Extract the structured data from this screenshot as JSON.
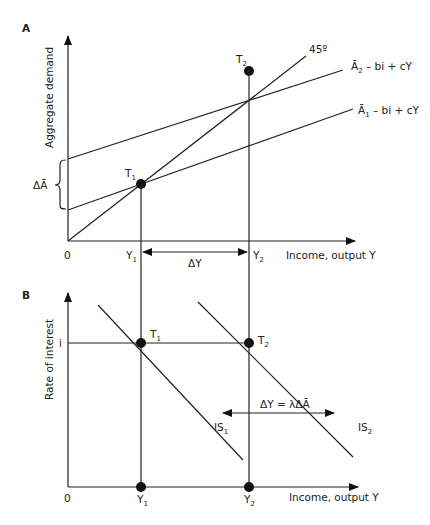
{
  "figure": {
    "panel_a": {
      "label": "A",
      "y_axis_label": "Aggregate demand",
      "x_axis_label": "Income, output Y",
      "origin_label": "0",
      "line_45_label": "45º",
      "ad2_label_main": "Ā",
      "ad2_label_sub": "2",
      "ad2_label_rest": " – bi + cY",
      "ad1_label_main": "Ā",
      "ad1_label_sub": "1",
      "ad1_label_rest": " – bi + cY",
      "delta_a_label": "ΔĀ",
      "t1_main": "T",
      "t1_sub": "1",
      "t2_main": "T",
      "t2_sub": "2",
      "y1_main": "Y",
      "y1_sub": "1",
      "y2_main": "Y",
      "y2_sub": "2",
      "delta_y_label": "ΔY"
    },
    "panel_b": {
      "label": "B",
      "y_axis_label": "Rate of interest",
      "x_axis_label": "Income, output Y",
      "origin_label": "0",
      "i_label": "i",
      "t1_main": "T",
      "t1_sub": "1",
      "t2_main": "T",
      "t2_sub": "2",
      "is1_main": "IS",
      "is1_sub": "1",
      "is2_main": "IS",
      "is2_sub": "2",
      "y1_main": "Y",
      "y1_sub": "1",
      "y2_main": "Y",
      "y2_sub": "2",
      "shift_label": "ΔY = λΔĀ"
    }
  },
  "colors": {
    "ink": "#222222",
    "background": "#ffffff"
  }
}
